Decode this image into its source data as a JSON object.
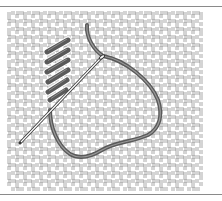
{
  "illustration": {
    "subject": "Needlepoint canvas with slanted stitches, threaded needle and loop of yarn",
    "colors": {
      "background": "#ffffff",
      "canvas_line": "#6e6e6e",
      "yarn": "#5a5a5a",
      "yarn_highlight": "#9a9a9a",
      "needle": "#3a3a3a",
      "rule": "#8a8a8a"
    },
    "canvas": {
      "x": 8,
      "y": 12,
      "width": 193,
      "height": 176,
      "cell": 8
    },
    "stitches": [
      {
        "x1": 47,
        "y1": 52,
        "x2": 68,
        "y2": 40
      },
      {
        "x1": 47,
        "y1": 62,
        "x2": 68,
        "y2": 50
      },
      {
        "x1": 47,
        "y1": 72,
        "x2": 68,
        "y2": 60
      },
      {
        "x1": 48,
        "y1": 82,
        "x2": 68,
        "y2": 70
      },
      {
        "x1": 48,
        "y1": 92,
        "x2": 67,
        "y2": 80
      },
      {
        "x1": 50,
        "y1": 100,
        "x2": 66,
        "y2": 90
      }
    ],
    "needle": {
      "tip_x": 20,
      "tip_y": 143,
      "eye_x": 102,
      "eye_y": 57
    },
    "yarn_path": "M87,25 C86,38 94,50 103,56 C125,60 150,80 158,100 C163,115 160,128 148,135 C132,142 115,142 102,150 C92,156 80,160 70,154 C58,146 50,128 50,110"
  }
}
